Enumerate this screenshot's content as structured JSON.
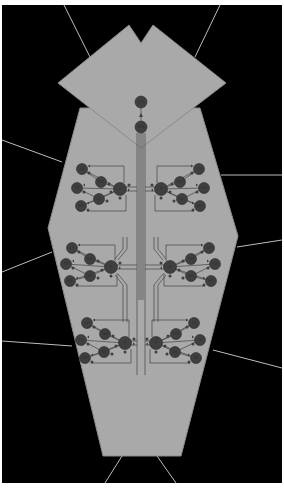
{
  "diagram": {
    "title": "",
    "colors": {
      "background": "#000000",
      "frame": "#ffffff",
      "shape_fill": "#a9a9a9",
      "shape_stroke": "#8a8a8a",
      "node_fill": "#3f3f3f",
      "node_stroke": "#2a2a2a",
      "wire": "#444444",
      "leader": "#bdbdbd"
    },
    "top": {
      "nodes": [
        {
          "id": "top-1",
          "label": "ICU",
          "cx": 141,
          "cy": 102,
          "r": 6
        },
        {
          "id": "top-2",
          "label": "ETX",
          "cx": 141,
          "cy": 127,
          "r": 6
        }
      ]
    },
    "clusters": [
      {
        "id": "upper-left",
        "side": "left",
        "hub": {
          "label": "P",
          "cx": 120,
          "cy": 189,
          "r": 6.5
        },
        "inner": [
          {
            "label": "TXC",
            "cx": 101,
            "cy": 182
          },
          {
            "label": "S/L",
            "cx": 99,
            "cy": 199
          }
        ],
        "outer": [
          {
            "label": "LP",
            "cx": 82,
            "cy": 169
          },
          {
            "label": "CP",
            "cx": 77,
            "cy": 188
          },
          {
            "label": "RS",
            "cx": 81,
            "cy": 206
          }
        ]
      },
      {
        "id": "upper-right",
        "side": "right",
        "hub": {
          "label": "P",
          "cx": 161,
          "cy": 189,
          "r": 6.5
        },
        "inner": [
          {
            "label": "TXC",
            "cx": 180,
            "cy": 182
          },
          {
            "label": "S/L",
            "cx": 182,
            "cy": 199
          }
        ],
        "outer": [
          {
            "label": "LP",
            "cx": 199,
            "cy": 169
          },
          {
            "label": "CP",
            "cx": 204,
            "cy": 188
          },
          {
            "label": "RS",
            "cx": 200,
            "cy": 206
          }
        ]
      },
      {
        "id": "middle-left",
        "side": "left",
        "hub": {
          "label": "P",
          "cx": 111,
          "cy": 267,
          "r": 6.5
        },
        "inner": [
          {
            "label": "TXC",
            "cx": 90,
            "cy": 259
          },
          {
            "label": "S/L",
            "cx": 90,
            "cy": 276
          }
        ],
        "outer": [
          {
            "label": "LP",
            "cx": 72,
            "cy": 248
          },
          {
            "label": "CP",
            "cx": 66,
            "cy": 264
          },
          {
            "label": "RS",
            "cx": 70,
            "cy": 281
          }
        ]
      },
      {
        "id": "middle-right",
        "side": "right",
        "hub": {
          "label": "P",
          "cx": 170,
          "cy": 267,
          "r": 6.5
        },
        "inner": [
          {
            "label": "TXC",
            "cx": 191,
            "cy": 259
          },
          {
            "label": "S/L",
            "cx": 191,
            "cy": 276
          }
        ],
        "outer": [
          {
            "label": "LP",
            "cx": 209,
            "cy": 248
          },
          {
            "label": "CP",
            "cx": 215,
            "cy": 264
          },
          {
            "label": "RS",
            "cx": 211,
            "cy": 281
          }
        ]
      },
      {
        "id": "lower-left",
        "side": "left",
        "hub": {
          "label": "P",
          "cx": 125,
          "cy": 343,
          "r": 6.5
        },
        "inner": [
          {
            "label": "TXC",
            "cx": 105,
            "cy": 334
          },
          {
            "label": "S/L",
            "cx": 104,
            "cy": 352
          }
        ],
        "outer": [
          {
            "label": "LP",
            "cx": 87,
            "cy": 323
          },
          {
            "label": "CP",
            "cx": 81,
            "cy": 340
          },
          {
            "label": "RS",
            "cx": 85,
            "cy": 358
          }
        ]
      },
      {
        "id": "lower-right",
        "side": "right",
        "hub": {
          "label": "P",
          "cx": 156,
          "cy": 343,
          "r": 6.5
        },
        "inner": [
          {
            "label": "TXC",
            "cx": 176,
            "cy": 334
          },
          {
            "label": "S/L",
            "cx": 175,
            "cy": 352
          }
        ],
        "outer": [
          {
            "label": "LP",
            "cx": 194,
            "cy": 323
          },
          {
            "label": "CP",
            "cx": 200,
            "cy": 340
          },
          {
            "label": "RS",
            "cx": 196,
            "cy": 358
          }
        ]
      }
    ],
    "leader_lines": [
      {
        "id": "leader-top-left",
        "x1": 64,
        "y1": 5,
        "x2": 90,
        "y2": 57
      },
      {
        "id": "leader-top-right",
        "x1": 220,
        "y1": 5,
        "x2": 195,
        "y2": 57
      },
      {
        "id": "leader-left-upper",
        "x1": 2,
        "y1": 140,
        "x2": 62,
        "y2": 162
      },
      {
        "id": "leader-right-upper",
        "x1": 221,
        "y1": 175,
        "x2": 282,
        "y2": 175
      },
      {
        "id": "leader-left-middle",
        "x1": 2,
        "y1": 272,
        "x2": 52,
        "y2": 252
      },
      {
        "id": "leader-right-middle",
        "x1": 237,
        "y1": 247,
        "x2": 282,
        "y2": 240
      },
      {
        "id": "leader-left-lower",
        "x1": 2,
        "y1": 341,
        "x2": 72,
        "y2": 346
      },
      {
        "id": "leader-right-lower",
        "x1": 213,
        "y1": 350,
        "x2": 282,
        "y2": 368
      },
      {
        "id": "leader-bottom-left",
        "x1": 105,
        "y1": 483,
        "x2": 122,
        "y2": 456
      },
      {
        "id": "leader-bottom-right",
        "x1": 176,
        "y1": 483,
        "x2": 157,
        "y2": 456
      }
    ]
  }
}
